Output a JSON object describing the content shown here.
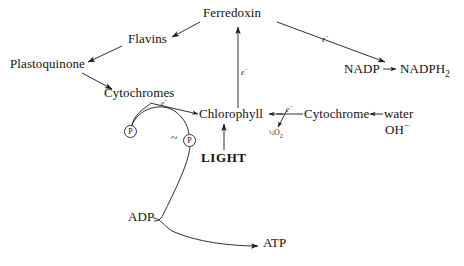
{
  "diagram": {
    "background_color": "#ffffff",
    "ink_color": "#1a1a1a",
    "width": 464,
    "height": 266,
    "nodes": {
      "ferredoxin": "Ferredoxin",
      "flavins": "Flavins",
      "plastoquinone": "Plastoquinone",
      "cytochromes": "Cytochromes",
      "chlorophyll": "Chlorophyll",
      "cytochrome": "Cytochrome",
      "water": "water",
      "hydroxide": "OH−",
      "nadp": "NADP",
      "nadph2": "NADPH₂",
      "light": "LIGHT",
      "adp": "ADP",
      "atp": "ATP",
      "phosphate_1": "P",
      "phosphate_2": "P",
      "bond_tilde": "~",
      "half_oxygen": "½O₂"
    },
    "edge_labels": {
      "electron_ferredoxin_to_nadp": "e−",
      "electron_chlorophyll_to_ferredoxin": "e−",
      "electron_cytochromes_to_chlorophyll": "e−",
      "electron_cytochrome_to_chlorophyll": "e−"
    },
    "edges": [
      {
        "from": "ferredoxin",
        "to": "flavins",
        "kind": "arrow"
      },
      {
        "from": "flavins",
        "to": "plastoquinone",
        "kind": "arrow"
      },
      {
        "from": "plastoquinone",
        "to": "cytochromes",
        "kind": "arrow"
      },
      {
        "from": "cytochromes",
        "to": "chlorophyll",
        "kind": "arrow",
        "label": "e−"
      },
      {
        "from": "chlorophyll",
        "to": "ferredoxin",
        "kind": "arrow",
        "label": "e−"
      },
      {
        "from": "ferredoxin",
        "to": "nadp",
        "kind": "arrow",
        "label": "e−"
      },
      {
        "from": "nadp",
        "to": "nadph2",
        "kind": "arrow"
      },
      {
        "from": "cytochrome",
        "to": "chlorophyll",
        "kind": "arrow",
        "label": "e−"
      },
      {
        "from": "cytochrome",
        "to": "half_oxygen",
        "kind": "arrow"
      },
      {
        "from": "water",
        "to": "cytochrome",
        "kind": "arrow"
      },
      {
        "from": "light",
        "to": "chlorophyll",
        "kind": "arrow"
      },
      {
        "from": "cytochromes",
        "to": "phosphate_1",
        "kind": "curve"
      },
      {
        "from": "phosphate_2",
        "to": "cytochromes",
        "kind": "curve"
      },
      {
        "from": "phosphate_2",
        "to": "adp",
        "kind": "curve"
      },
      {
        "from": "adp",
        "to": "atp",
        "kind": "arrow"
      }
    ]
  }
}
